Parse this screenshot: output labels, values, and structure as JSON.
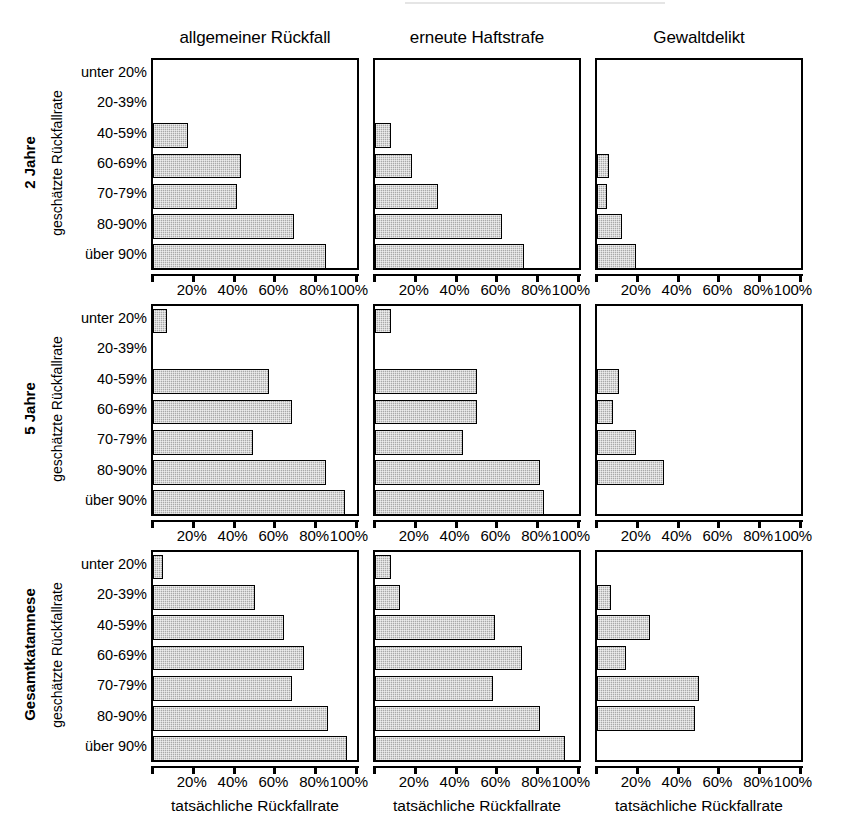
{
  "figure": {
    "column_titles": [
      "allgemeiner Rückfall",
      "erneute Haftstrafe",
      "Gewaltdelikt"
    ],
    "row_titles": [
      "2 Jahre",
      "5 Jahre",
      "Gesamtkatamnese"
    ],
    "row_axis_label": "geschätzte Rückfallrate",
    "x_axis_label": "tatsächliche Rückfallrate",
    "categories": [
      "unter 20%",
      "20-39%",
      "40-59%",
      "60-69%",
      "70-79%",
      "80-90%",
      "über 90%"
    ],
    "x_tick_labels": [
      "20%",
      "40%",
      "60%",
      "80%",
      "100%"
    ],
    "x_tick_values": [
      20,
      40,
      60,
      80,
      100
    ],
    "bar_fill_color": "#a9a9a9",
    "bar_edge_color": "#000000",
    "axis_color": "#000000",
    "background_color": "#ffffff"
  },
  "chart_data": {
    "type": "bar",
    "orientation": "horizontal",
    "title": "",
    "xlabel": "tatsächliche Rückfallrate",
    "ylabel": "geschätzte Rückfallrate",
    "xlim": [
      0,
      100
    ],
    "grid": false,
    "legend": "none",
    "categories": [
      "unter 20%",
      "20-39%",
      "40-59%",
      "60-69%",
      "70-79%",
      "80-90%",
      "über 90%"
    ],
    "panels": [
      {
        "row": "2 Jahre",
        "column": "allgemeiner Rückfall",
        "values": [
          0,
          0,
          17,
          43,
          41,
          69,
          85
        ]
      },
      {
        "row": "2 Jahre",
        "column": "erneute Haftstrafe",
        "values": [
          0,
          0,
          8,
          18,
          31,
          62,
          73
        ]
      },
      {
        "row": "2 Jahre",
        "column": "Gewaltdelikt",
        "values": [
          0,
          0,
          0,
          6,
          5,
          12,
          19
        ]
      },
      {
        "row": "5 Jahre",
        "column": "allgemeiner Rückfall",
        "values": [
          7,
          0,
          57,
          68,
          49,
          85,
          94
        ]
      },
      {
        "row": "5 Jahre",
        "column": "erneute Haftstrafe",
        "values": [
          8,
          0,
          50,
          50,
          43,
          81,
          83
        ]
      },
      {
        "row": "5 Jahre",
        "column": "Gewaltdelikt",
        "values": [
          0,
          0,
          11,
          8,
          19,
          33,
          0
        ]
      },
      {
        "row": "Gesamtkatamnese",
        "column": "allgemeiner Rückfall",
        "values": [
          5,
          50,
          64,
          74,
          68,
          86,
          95
        ]
      },
      {
        "row": "Gesamtkatamnese",
        "column": "erneute Haftstrafe",
        "values": [
          8,
          12,
          59,
          72,
          58,
          81,
          93
        ]
      },
      {
        "row": "Gesamtkatamnese",
        "column": "Gewaltdelikt",
        "values": [
          0,
          7,
          26,
          14,
          50,
          48,
          0
        ]
      }
    ]
  }
}
